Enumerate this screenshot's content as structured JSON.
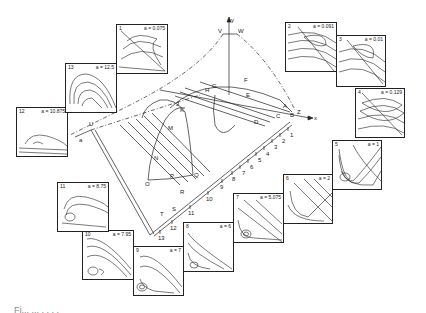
{
  "figure": {
    "caption_partial": "Fi... ... . . . ."
  },
  "center_diagram": {
    "axes": {
      "y": "y",
      "x": "x",
      "z": "Z",
      "v": "V",
      "w": "W",
      "u": "U",
      "a": "a"
    },
    "point_labels": [
      "A",
      "B",
      "C",
      "D",
      "E",
      "F",
      "G",
      "H",
      "I",
      "J",
      "K",
      "L",
      "M",
      "N",
      "O",
      "P",
      "Q",
      "R",
      "S",
      "T"
    ],
    "ticks": [
      "1",
      "2",
      "3",
      "4",
      "5",
      "6",
      "7",
      "8",
      "9",
      "10",
      "11",
      "12",
      "13"
    ]
  },
  "panels": [
    {
      "num": "1",
      "param": "a = 0.075"
    },
    {
      "num": "2",
      "param": "a = 0.091"
    },
    {
      "num": "3",
      "param": "a = 0.01"
    },
    {
      "num": "4",
      "param": "a = 0.129"
    },
    {
      "num": "5",
      "param": "a = 1"
    },
    {
      "num": "6",
      "param": "a = 2"
    },
    {
      "num": "7",
      "param": "a = 5.075"
    },
    {
      "num": "8",
      "param": "a = 6"
    },
    {
      "num": "9",
      "param": "a = 7"
    },
    {
      "num": "10",
      "param": "a = 7.95"
    },
    {
      "num": "11",
      "param": "a = 8.75"
    },
    {
      "num": "12",
      "param": "a = 10.875"
    },
    {
      "num": "13",
      "param": "a = 12.5"
    }
  ]
}
